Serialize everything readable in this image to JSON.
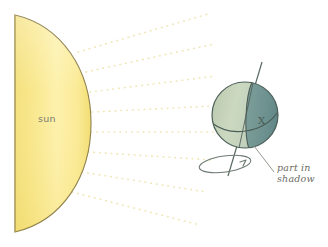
{
  "diagram": {
    "background_color": "#ffffff"
  },
  "sun": {
    "label": "sun",
    "label_color": "#7a7a72",
    "fill_light": "#fff4b0",
    "fill_mid": "#f7e483",
    "fill_dark": "#efd95f",
    "outline_color": "#8a7a42",
    "shape": "half-disc-arc-facing-right"
  },
  "rays": {
    "count": 8,
    "style": "dotted",
    "color": "#f2e8b8",
    "description": "dotted sunlight rays radiating right from the sun toward the earth"
  },
  "earth": {
    "lit_side_color": "#c9d6bd",
    "shadow_side_color": "#6f9290",
    "outline_color": "#4c5f58",
    "terminator_label": "terminator",
    "equator_label": "equator",
    "marker": {
      "label": "X",
      "color": "#3f5049"
    },
    "axis": {
      "label": "rotation axis",
      "color": "#51615a"
    },
    "rotation": {
      "label": "rotation direction",
      "arrow": "counterclockwise-ellipse"
    }
  },
  "annotations": {
    "shadow": {
      "line1": "part in",
      "line2": "shadow",
      "color": "#6b6b63",
      "leader_line_color": "#8b8b84"
    }
  }
}
